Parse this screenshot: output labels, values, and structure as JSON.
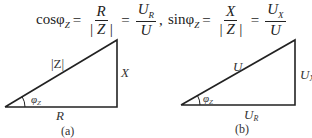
{
  "formulas": {
    "cos": {
      "lhs": "cosφ",
      "lhs_sub": "Z",
      "eq": "=",
      "frac1": {
        "num": "R",
        "den": "| Z |"
      },
      "frac2": {
        "num": "U",
        "num_sub": "R",
        "den": "U"
      },
      "trail": ","
    },
    "sin": {
      "lhs": "sinφ",
      "lhs_sub": "Z",
      "eq": "=",
      "frac1": {
        "num": "X",
        "den": "| Z |"
      },
      "frac2": {
        "num": "U",
        "num_sub": "X",
        "den": "U"
      }
    }
  },
  "diagram_a": {
    "hypotenuse_label": "|Z|",
    "vertical_label": "X",
    "base_label": "R",
    "angle_label": "φ",
    "angle_sub": "Z",
    "caption": "(a)"
  },
  "diagram_b": {
    "hypotenuse_label": "U",
    "vertical_label": "U",
    "vertical_sub": "X",
    "base_label": "U",
    "base_sub": "R",
    "angle_label": "φ",
    "angle_sub": "Z",
    "caption": "(b)"
  }
}
